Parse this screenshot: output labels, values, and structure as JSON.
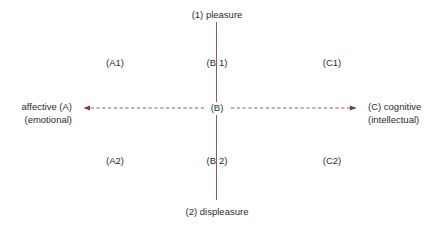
{
  "diagram": {
    "title_text": "",
    "colors": {
      "axis": "#8a5b60",
      "arrow": "#7a3b45",
      "text": "#2b2b2b",
      "background": "#ffffff"
    },
    "axes": {
      "vertical": {
        "top_label": "(1) pleasure",
        "bottom_label": "(2) displeasure",
        "style": "solid"
      },
      "horizontal": {
        "left_label_line1": "affective (A)",
        "left_label_line2": "(emotional)",
        "right_label_line1": "(C) cognitive",
        "right_label_line2": "(intellectual)",
        "style": "dashed",
        "arrowheads": "both"
      }
    },
    "origin_label": "(B)",
    "quadrants": [
      {
        "id": "A1",
        "label": "(A1)"
      },
      {
        "id": "B1",
        "label_left": "(B",
        "label_right": "1)"
      },
      {
        "id": "C1",
        "label": "(C1)"
      },
      {
        "id": "A2",
        "label": "(A2)"
      },
      {
        "id": "B2",
        "label_left": "(B",
        "label_right": "2)"
      },
      {
        "id": "C2",
        "label": "(C2)"
      }
    ]
  }
}
